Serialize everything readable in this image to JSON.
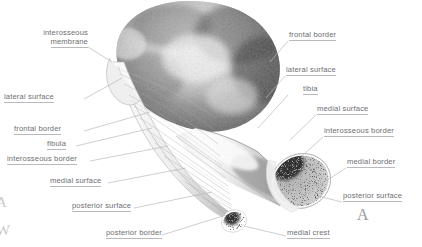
{
  "figure": {
    "panel_marker_left": "A",
    "panel_marker_right": "A",
    "watermark_top": "A",
    "watermark_bottom": "W",
    "colors": {
      "background": "#ffffff",
      "label_text": "#6e6e72",
      "leader_line": "#b9b9bd",
      "marker": "#9a9a9e",
      "bone_dark": "#3a3a3a",
      "bone_mid": "#9b9b9b",
      "bone_light": "#e8e8e8"
    }
  },
  "labels_left": [
    {
      "id": "interosseous-membrane",
      "line1": "interosseous",
      "line2": "membrane"
    },
    {
      "id": "lateral-surface",
      "text": "lateral surface"
    },
    {
      "id": "frontal-border",
      "text": "frontal border"
    },
    {
      "id": "fibula",
      "text": "fibula"
    },
    {
      "id": "interosseous-border",
      "text": "interosseous border"
    },
    {
      "id": "medial-surface",
      "text": "medial surface"
    },
    {
      "id": "posterior-surface",
      "text": "posterior surface"
    },
    {
      "id": "posterior-border",
      "text": "posterior border"
    }
  ],
  "labels_right": [
    {
      "id": "frontal-border",
      "text": "frontal border"
    },
    {
      "id": "lateral-surface",
      "text": "lateral surface"
    },
    {
      "id": "tibia",
      "text": "tibia"
    },
    {
      "id": "medial-surface",
      "text": "medial surface"
    },
    {
      "id": "interosseous-border",
      "text": "interosseous border"
    },
    {
      "id": "medial-border",
      "text": "medial border"
    },
    {
      "id": "posterior-surface",
      "text": "posterior surface"
    }
  ],
  "labels_bottom": [
    {
      "id": "medial-crest",
      "text": "medial crest"
    }
  ]
}
